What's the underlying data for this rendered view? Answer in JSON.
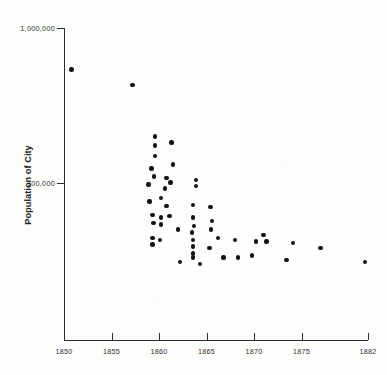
{
  "chart_data": {
    "type": "scatter",
    "title": "",
    "xlabel": "",
    "ylabel": "Population of City",
    "yscale": "log",
    "xlim": [
      1850,
      1882
    ],
    "ylim": [
      20000,
      1000000
    ],
    "grid": false,
    "legend": null,
    "xticks": [
      {
        "value": 1850,
        "label": "1850"
      },
      {
        "value": 1855,
        "label": "1855"
      },
      {
        "value": 1860,
        "label": "1860"
      },
      {
        "value": 1865,
        "label": "1865"
      },
      {
        "value": 1870,
        "label": "1870"
      },
      {
        "value": 1875,
        "label": "1875"
      },
      {
        "value": 1882,
        "label": "1882"
      }
    ],
    "yticks": [
      {
        "value": 1000000,
        "label": "1,000,000"
      },
      {
        "value": 100000,
        "label": "100,000"
      }
    ],
    "points": [
      {
        "x": 1850.8,
        "y": 540000
      },
      {
        "x": 1857.2,
        "y": 430000
      },
      {
        "x": 1859.6,
        "y": 200000
      },
      {
        "x": 1859.6,
        "y": 175000
      },
      {
        "x": 1861.3,
        "y": 183000
      },
      {
        "x": 1859.6,
        "y": 150000
      },
      {
        "x": 1861.5,
        "y": 132000
      },
      {
        "x": 1859.2,
        "y": 124000
      },
      {
        "x": 1859.5,
        "y": 110000
      },
      {
        "x": 1860.8,
        "y": 108000
      },
      {
        "x": 1861.2,
        "y": 101000
      },
      {
        "x": 1858.9,
        "y": 98000
      },
      {
        "x": 1860.6,
        "y": 92000
      },
      {
        "x": 1863.9,
        "y": 105000
      },
      {
        "x": 1863.9,
        "y": 96000
      },
      {
        "x": 1860.2,
        "y": 80000
      },
      {
        "x": 1859.0,
        "y": 76000
      },
      {
        "x": 1860.8,
        "y": 71000
      },
      {
        "x": 1863.6,
        "y": 72000
      },
      {
        "x": 1865.4,
        "y": 70000
      },
      {
        "x": 1859.3,
        "y": 62000
      },
      {
        "x": 1860.2,
        "y": 60000
      },
      {
        "x": 1861.1,
        "y": 61000
      },
      {
        "x": 1863.6,
        "y": 60000
      },
      {
        "x": 1865.6,
        "y": 57000
      },
      {
        "x": 1859.4,
        "y": 55000
      },
      {
        "x": 1860.2,
        "y": 54000
      },
      {
        "x": 1863.7,
        "y": 53000
      },
      {
        "x": 1865.5,
        "y": 50000
      },
      {
        "x": 1862.0,
        "y": 50000
      },
      {
        "x": 1863.5,
        "y": 48000
      },
      {
        "x": 1859.3,
        "y": 44000
      },
      {
        "x": 1860.1,
        "y": 43000
      },
      {
        "x": 1863.6,
        "y": 43000
      },
      {
        "x": 1866.2,
        "y": 44000
      },
      {
        "x": 1868.0,
        "y": 43000
      },
      {
        "x": 1859.3,
        "y": 40000
      },
      {
        "x": 1863.6,
        "y": 39000
      },
      {
        "x": 1865.3,
        "y": 38000
      },
      {
        "x": 1870.2,
        "y": 42000
      },
      {
        "x": 1871.0,
        "y": 46000
      },
      {
        "x": 1871.3,
        "y": 42000
      },
      {
        "x": 1874.1,
        "y": 41000
      },
      {
        "x": 1863.6,
        "y": 35000
      },
      {
        "x": 1863.6,
        "y": 33000
      },
      {
        "x": 1866.8,
        "y": 33000
      },
      {
        "x": 1868.3,
        "y": 33000
      },
      {
        "x": 1869.8,
        "y": 34000
      },
      {
        "x": 1873.4,
        "y": 32000
      },
      {
        "x": 1877.0,
        "y": 38000
      },
      {
        "x": 1881.7,
        "y": 31000
      },
      {
        "x": 1862.2,
        "y": 31000
      },
      {
        "x": 1864.3,
        "y": 30000
      }
    ]
  }
}
